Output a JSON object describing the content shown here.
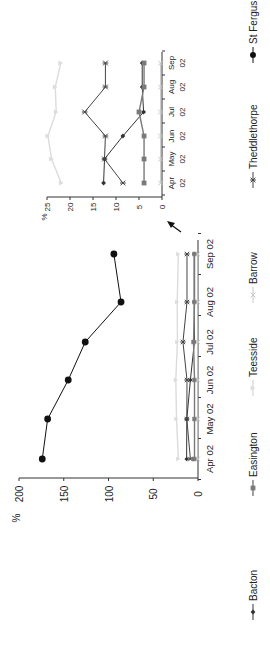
{
  "chart_data": [
    {
      "type": "line",
      "title": "",
      "orientation_note": "figure rotated 90 degrees counter-clockwise",
      "ylabel": "%",
      "xlabel": "",
      "ylim": [
        0,
        200
      ],
      "yticks": [
        0,
        50,
        100,
        150,
        200
      ],
      "categories": [
        "Apr 02",
        "May 02",
        "Jun 02",
        "Jul 02",
        "Aug 02",
        "Sep 02"
      ],
      "grid": false,
      "series": [
        {
          "name": "Bacton",
          "values": [
            12.7,
            12.5,
            8.5,
            4.0,
            4.3,
            4.3
          ]
        },
        {
          "name": "Easington",
          "values": [
            3.9,
            3.9,
            3.9,
            5.0,
            3.9,
            3.9
          ]
        },
        {
          "name": "Teesside",
          "values": [
            21.9,
            24.0,
            24.8,
            23.0,
            23.2,
            22.0
          ]
        },
        {
          "name": "Barrow",
          "values": [
            0.3,
            0.3,
            0.3,
            0.3,
            0.3,
            0.3
          ]
        },
        {
          "name": "Theddlethorpe",
          "values": [
            8.5,
            12.5,
            12.3,
            16.8,
            12.3,
            12.3
          ]
        },
        {
          "name": "St Fergus",
          "values": [
            174,
            168,
            145,
            126,
            86,
            94
          ]
        }
      ]
    },
    {
      "type": "line",
      "title": "",
      "note": "inset zoom of lower range, indicated by arrow",
      "ylabel": "%",
      "ylim": [
        0,
        25
      ],
      "yticks": [
        0,
        5,
        10,
        15,
        20,
        25
      ],
      "categories": [
        "Apr 02",
        "May 02",
        "Jun 02",
        "Jul 02",
        "Aug 02",
        "Sep 02"
      ],
      "category_lines": [
        [
          "Apr",
          "02"
        ],
        [
          "May",
          "02"
        ],
        [
          "Jun",
          "02"
        ],
        [
          "Jul",
          "02"
        ],
        [
          "Aug",
          "02"
        ],
        [
          "Sep",
          "02"
        ]
      ],
      "series": [
        {
          "name": "Bacton",
          "values": [
            12.7,
            12.5,
            8.5,
            4.0,
            4.3,
            4.3
          ]
        },
        {
          "name": "Easington",
          "values": [
            3.9,
            3.9,
            3.9,
            5.0,
            3.9,
            3.9
          ]
        },
        {
          "name": "Teesside",
          "values": [
            21.9,
            24.0,
            24.8,
            23.0,
            23.2,
            22.0
          ]
        },
        {
          "name": "Barrow",
          "values": [
            0.3,
            0.3,
            0.3,
            0.3,
            0.3,
            0.3
          ]
        },
        {
          "name": "Theddlethorpe",
          "values": [
            8.5,
            12.5,
            12.3,
            16.8,
            12.3,
            12.3
          ]
        }
      ]
    }
  ],
  "legend": {
    "position": "bottom",
    "items": [
      {
        "label": "Bacton",
        "marker": "diamond",
        "color": "#333333"
      },
      {
        "label": "Easington",
        "marker": "square",
        "color": "#7a7a7a"
      },
      {
        "label": "Teesside",
        "marker": "triangle",
        "color": "#d8d8d8"
      },
      {
        "label": "Barrow",
        "marker": "x",
        "color": "#c4c4c4"
      },
      {
        "label": "Theddlethorpe",
        "marker": "asterisk",
        "color": "#444444"
      },
      {
        "label": "St Fergus",
        "marker": "circle",
        "color": "#111111"
      }
    ]
  },
  "main_axis": {
    "unit_label": "%",
    "ticks": [
      "0",
      "50",
      "100",
      "150",
      "200"
    ]
  },
  "inset_axis": {
    "unit_label": "%",
    "ticks": [
      "0",
      "5",
      "10",
      "15",
      "20",
      "25"
    ]
  }
}
